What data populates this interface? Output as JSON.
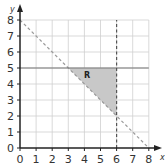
{
  "chart_data": {
    "type": "line",
    "title": "",
    "xlabel": "x",
    "ylabel": "y",
    "xlim": [
      0,
      8
    ],
    "ylim": [
      0,
      8
    ],
    "grid": true,
    "x_ticks": [
      "0",
      "1",
      "2",
      "3",
      "4",
      "5",
      "6",
      "7",
      "8"
    ],
    "y_ticks": [
      "0",
      "1",
      "2",
      "3",
      "4",
      "5",
      "6",
      "7",
      "8"
    ],
    "series": [
      {
        "name": "x + y = 8",
        "style": "dashed",
        "color": "#999999",
        "points": [
          [
            0,
            8
          ],
          [
            8,
            0
          ]
        ]
      },
      {
        "name": "y = 5",
        "style": "solid",
        "color": "#777777",
        "points": [
          [
            0,
            5
          ],
          [
            8,
            5
          ]
        ]
      },
      {
        "name": "x = 6",
        "style": "dashed",
        "color": "#555555",
        "points": [
          [
            6,
            0
          ],
          [
            6,
            8
          ]
        ]
      }
    ],
    "shaded_region": {
      "label": "R",
      "vertices": [
        [
          3,
          5
        ],
        [
          6,
          5
        ],
        [
          6,
          2
        ]
      ],
      "color": "#c8c8c8"
    }
  },
  "labels": {
    "x_axis": "x",
    "y_axis": "y",
    "region": "R"
  }
}
